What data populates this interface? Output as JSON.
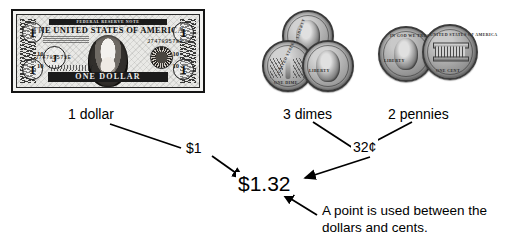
{
  "diagram": {
    "background_color": "#ffffff",
    "line_color": "#000000"
  },
  "items": [
    {
      "id": "dollar",
      "caption": "1 dollar",
      "value_label": "$1"
    },
    {
      "id": "dimes",
      "caption": "3 dimes"
    },
    {
      "id": "pennies",
      "caption": "2 pennies"
    }
  ],
  "nodes": {
    "dollar_amount": "$1",
    "cents_amount": "32¢",
    "total": "$1.32"
  },
  "callout": {
    "text": "A point is used between the\ndollars and cents."
  },
  "bill": {
    "federal_reserve_note": "FEDERAL RESERVE NOTE",
    "country": "THE UNITED STATES OF AMERICA",
    "denomination_word": "ONE DOLLAR",
    "corner_numeral": "1",
    "district_letter": "J",
    "district_number": "10",
    "serial": "J74789578E"
  },
  "coins": {
    "dime": {
      "obverse_legend": "LIBERTY",
      "reverse_legend": "ONE DIME",
      "reverse_country": "UNITED STATES"
    },
    "penny": {
      "obverse_motto": "IN GOD WE TRUST",
      "obverse_legend": "LIBERTY",
      "reverse_country": "UNITED STATES OF AMERICA",
      "reverse_legend": "ONE CENT"
    }
  }
}
